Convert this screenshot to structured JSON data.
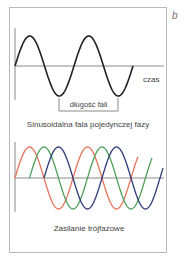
{
  "panel_label": "b",
  "single_phase": {
    "axis_label": "czas",
    "wavelength_label": "długość fali",
    "caption": "Sinusoidalna fala pojedynczej fazy",
    "wave_color": "#222222"
  },
  "three_phase": {
    "caption": "Zasilanie trójfazowe",
    "phases": [
      {
        "name": "phase-1",
        "color": "#e8735a"
      },
      {
        "name": "phase-2",
        "color": "#4ea05a"
      },
      {
        "name": "phase-3",
        "color": "#2e3a78"
      }
    ]
  },
  "colors": {
    "axis": "#8a8a8a",
    "card_border": "#b9b9b9",
    "text": "#444444"
  }
}
